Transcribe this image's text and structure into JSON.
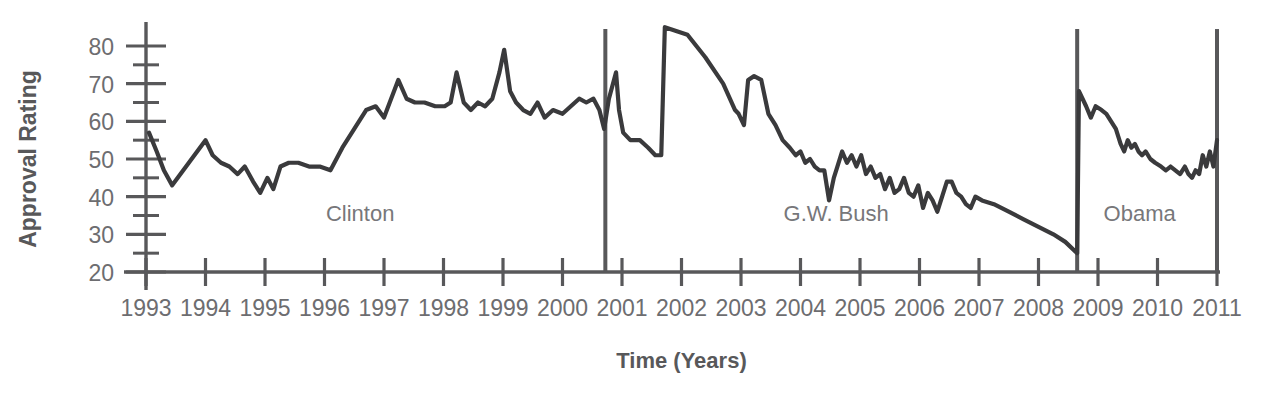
{
  "chart_data": {
    "type": "line",
    "title": "",
    "xlabel": "Time (Years)",
    "ylabel": "Approval Rating",
    "xlim": [
      1993.0,
      2011.0
    ],
    "ylim": [
      20,
      80
    ],
    "y_ticks": [
      20,
      30,
      40,
      50,
      60,
      70,
      80
    ],
    "y_minor_ticks": [
      25,
      35,
      45,
      55,
      65,
      75
    ],
    "x_ticks": [
      1993,
      1994,
      1995,
      1996,
      1997,
      1998,
      1999,
      2000,
      2001,
      2002,
      2003,
      2004,
      2005,
      2006,
      2007,
      2008,
      2009,
      2010,
      2011
    ],
    "x_tick_labels": [
      "1993",
      "1994",
      "1995",
      "1996",
      "1997",
      "1998",
      "1999",
      "2000",
      "2001",
      "2002",
      "2003",
      "2004",
      "2005",
      "2006",
      "2007",
      "2008",
      "2009",
      "2010",
      "2011"
    ],
    "grid": false,
    "legend": null,
    "line_color": "#3a3a3c",
    "axis_color": "#58585a",
    "annotations": [
      {
        "label": "Clinton",
        "x": 1996.6,
        "y": 33.5
      },
      {
        "label": "G.W. Bush",
        "x": 2004.6,
        "y": 33.5
      },
      {
        "label": "Obama",
        "x": 2009.7,
        "y": 33.5
      }
    ],
    "dividers": [
      {
        "x": 2000.72,
        "y_top": 84.5,
        "y_bottom": 20
      },
      {
        "x": 2008.65,
        "y_top": 84.5,
        "y_bottom": 20
      },
      {
        "x": 2011.0,
        "y_top": 84.5,
        "y_bottom": 20
      }
    ],
    "series": [
      {
        "name": "Approval Rating",
        "points": [
          [
            1993.05,
            57
          ],
          [
            1993.18,
            52
          ],
          [
            1993.3,
            47
          ],
          [
            1993.44,
            43
          ],
          [
            1993.58,
            46
          ],
          [
            1993.72,
            49
          ],
          [
            1993.86,
            52
          ],
          [
            1994.0,
            55
          ],
          [
            1994.12,
            51
          ],
          [
            1994.26,
            49
          ],
          [
            1994.4,
            48
          ],
          [
            1994.54,
            46
          ],
          [
            1994.66,
            48
          ],
          [
            1994.8,
            44
          ],
          [
            1994.92,
            41
          ],
          [
            1995.04,
            45
          ],
          [
            1995.14,
            42
          ],
          [
            1995.26,
            48
          ],
          [
            1995.4,
            49
          ],
          [
            1995.56,
            49
          ],
          [
            1995.74,
            48
          ],
          [
            1995.92,
            48
          ],
          [
            1996.1,
            47
          ],
          [
            1996.3,
            53
          ],
          [
            1996.5,
            58
          ],
          [
            1996.7,
            63
          ],
          [
            1996.86,
            64
          ],
          [
            1997.0,
            61
          ],
          [
            1997.12,
            66
          ],
          [
            1997.24,
            71
          ],
          [
            1997.38,
            66
          ],
          [
            1997.52,
            65
          ],
          [
            1997.68,
            65
          ],
          [
            1997.86,
            64
          ],
          [
            1998.02,
            64
          ],
          [
            1998.12,
            65
          ],
          [
            1998.22,
            73
          ],
          [
            1998.34,
            65
          ],
          [
            1998.46,
            63
          ],
          [
            1998.58,
            65
          ],
          [
            1998.7,
            64
          ],
          [
            1998.82,
            66
          ],
          [
            1998.94,
            73
          ],
          [
            1999.02,
            79
          ],
          [
            1999.12,
            68
          ],
          [
            1999.22,
            65
          ],
          [
            1999.34,
            63
          ],
          [
            1999.46,
            62
          ],
          [
            1999.58,
            65
          ],
          [
            1999.7,
            61
          ],
          [
            1999.84,
            63
          ],
          [
            2000.0,
            62
          ],
          [
            2000.14,
            64
          ],
          [
            2000.28,
            66
          ],
          [
            2000.4,
            65
          ],
          [
            2000.52,
            66
          ],
          [
            2000.62,
            63
          ],
          [
            2000.7,
            58
          ],
          [
            2000.78,
            66
          ],
          [
            2000.9,
            73
          ],
          [
            2000.95,
            63
          ],
          [
            2001.02,
            57
          ],
          [
            2001.14,
            55
          ],
          [
            2001.3,
            55
          ],
          [
            2001.44,
            53
          ],
          [
            2001.56,
            51
          ],
          [
            2001.66,
            51
          ],
          [
            2001.72,
            85
          ],
          [
            2002.1,
            83
          ],
          [
            2002.4,
            77
          ],
          [
            2002.7,
            70
          ],
          [
            2002.9,
            63
          ],
          [
            2002.96,
            62
          ],
          [
            2003.05,
            59
          ],
          [
            2003.12,
            71
          ],
          [
            2003.22,
            72
          ],
          [
            2003.34,
            71
          ],
          [
            2003.46,
            62
          ],
          [
            2003.58,
            59
          ],
          [
            2003.7,
            55
          ],
          [
            2003.82,
            53
          ],
          [
            2003.92,
            51
          ],
          [
            2004.0,
            52
          ],
          [
            2004.08,
            49
          ],
          [
            2004.16,
            50
          ],
          [
            2004.24,
            48
          ],
          [
            2004.32,
            47
          ],
          [
            2004.4,
            47
          ],
          [
            2004.48,
            39
          ],
          [
            2004.56,
            45
          ],
          [
            2004.62,
            48
          ],
          [
            2004.7,
            52
          ],
          [
            2004.78,
            49
          ],
          [
            2004.86,
            51
          ],
          [
            2004.94,
            48
          ],
          [
            2005.02,
            51
          ],
          [
            2005.1,
            46
          ],
          [
            2005.18,
            48
          ],
          [
            2005.26,
            45
          ],
          [
            2005.34,
            46
          ],
          [
            2005.42,
            42
          ],
          [
            2005.5,
            45
          ],
          [
            2005.58,
            41
          ],
          [
            2005.66,
            42
          ],
          [
            2005.74,
            45
          ],
          [
            2005.82,
            41
          ],
          [
            2005.9,
            40
          ],
          [
            2005.98,
            43
          ],
          [
            2006.06,
            37
          ],
          [
            2006.14,
            41
          ],
          [
            2006.22,
            39
          ],
          [
            2006.3,
            36
          ],
          [
            2006.38,
            40
          ],
          [
            2006.46,
            44
          ],
          [
            2006.54,
            44
          ],
          [
            2006.62,
            41
          ],
          [
            2006.7,
            40
          ],
          [
            2006.78,
            38
          ],
          [
            2006.86,
            37
          ],
          [
            2006.94,
            40
          ],
          [
            2007.05,
            39
          ],
          [
            2007.25,
            38
          ],
          [
            2007.5,
            36
          ],
          [
            2007.75,
            34
          ],
          [
            2008.0,
            32
          ],
          [
            2008.25,
            30
          ],
          [
            2008.45,
            28
          ],
          [
            2008.65,
            25
          ],
          [
            2008.68,
            68
          ],
          [
            2008.8,
            64
          ],
          [
            2008.88,
            61
          ],
          [
            2008.96,
            64
          ],
          [
            2009.06,
            63
          ],
          [
            2009.14,
            62
          ],
          [
            2009.22,
            60
          ],
          [
            2009.3,
            58
          ],
          [
            2009.38,
            54
          ],
          [
            2009.44,
            52
          ],
          [
            2009.5,
            55
          ],
          [
            2009.56,
            53
          ],
          [
            2009.62,
            54
          ],
          [
            2009.68,
            52
          ],
          [
            2009.74,
            51
          ],
          [
            2009.8,
            52
          ],
          [
            2009.88,
            50
          ],
          [
            2009.96,
            49
          ],
          [
            2010.06,
            48
          ],
          [
            2010.14,
            47
          ],
          [
            2010.22,
            48
          ],
          [
            2010.3,
            47
          ],
          [
            2010.38,
            46
          ],
          [
            2010.46,
            48
          ],
          [
            2010.52,
            46
          ],
          [
            2010.58,
            45
          ],
          [
            2010.64,
            47
          ],
          [
            2010.7,
            46
          ],
          [
            2010.76,
            51
          ],
          [
            2010.82,
            48
          ],
          [
            2010.88,
            52
          ],
          [
            2010.94,
            48
          ],
          [
            2011.0,
            55
          ]
        ]
      }
    ]
  }
}
